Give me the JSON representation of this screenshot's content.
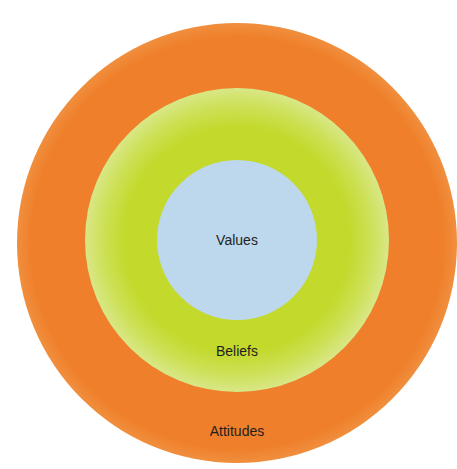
{
  "diagram": {
    "type": "concentric-circles",
    "layers": [
      {
        "label": "Values",
        "position": "inner",
        "color": "#bdd8ec"
      },
      {
        "label": "Beliefs",
        "position": "middle",
        "color": "#c3d92b"
      },
      {
        "label": "Attitudes",
        "position": "outer",
        "color": "#ef7f2a"
      }
    ]
  }
}
